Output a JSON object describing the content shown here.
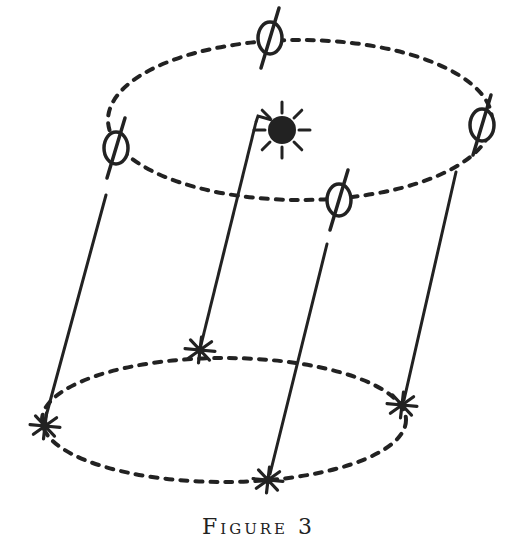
{
  "figure": {
    "caption": "Figure 3",
    "stroke_color": "#222222",
    "top_ellipse": {
      "cx": 300,
      "cy": 120,
      "rx": 192,
      "ry": 80,
      "label": "upper-ring"
    },
    "bottom_ellipse": {
      "cx": 224,
      "cy": 420,
      "rx": 182,
      "ry": 62,
      "label": "lower-ring"
    },
    "top_nodes": [
      {
        "id": "top-left",
        "type": "phi",
        "x": 116,
        "y": 148
      },
      {
        "id": "top-back",
        "type": "phi",
        "x": 270,
        "y": 38
      },
      {
        "id": "top-right",
        "type": "phi",
        "x": 482,
        "y": 125
      },
      {
        "id": "top-front",
        "type": "phi",
        "x": 339,
        "y": 200
      },
      {
        "id": "top-sun",
        "type": "filled-sun",
        "x": 282,
        "y": 130
      }
    ],
    "bottom_nodes": [
      {
        "id": "bottom-left",
        "type": "asterisk",
        "x": 45,
        "y": 426
      },
      {
        "id": "bottom-back",
        "type": "asterisk",
        "x": 200,
        "y": 350
      },
      {
        "id": "bottom-right",
        "type": "asterisk",
        "x": 402,
        "y": 405
      },
      {
        "id": "bottom-front",
        "type": "asterisk",
        "x": 268,
        "y": 480
      }
    ],
    "connectors": [
      {
        "from": [
          106,
          195
        ],
        "to": [
          45,
          420
        ]
      },
      {
        "from": [
          256,
          122
        ],
        "to": [
          201,
          345
        ]
      },
      {
        "from": [
          456,
          172
        ],
        "to": [
          404,
          400
        ]
      },
      {
        "from": [
          327,
          244
        ],
        "to": [
          270,
          474
        ]
      }
    ]
  }
}
